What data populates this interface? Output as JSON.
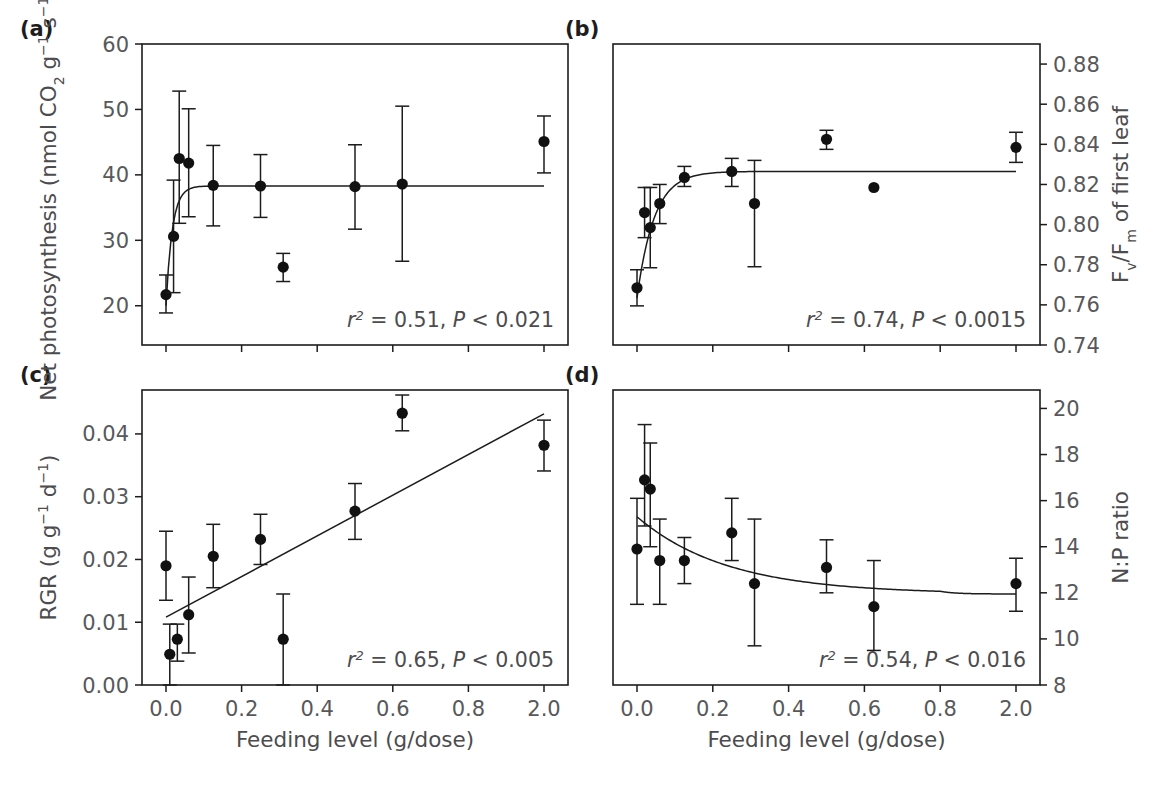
{
  "figure": {
    "xlabel": "Feeding level (g/dose)",
    "x_tick_labels": [
      "0.0",
      "0.2",
      "0.4",
      "0.6",
      "0.8",
      "2.0"
    ],
    "x_tick_values": [
      0.0,
      0.2,
      0.4,
      0.6,
      0.8,
      2.0
    ],
    "panels": [
      "(a)",
      "(b)",
      "(c)",
      "(d)"
    ]
  },
  "chart_data": [
    {
      "id": "a",
      "type": "scatter",
      "panel_label": "(a)",
      "title": "",
      "xlabel": "Feeding level (g/dose)",
      "ylabel": "Net photosynthesis (nmol CO2 g-1 s-1)",
      "ylabel_parts": {
        "prefix": "Net photosynthesis (nmol CO",
        "sub1": "2",
        "mid": " g",
        "sup1": "−1",
        "mid2": " s",
        "sup2": "−1",
        "suffix": ")"
      },
      "yaxis_side": "left",
      "ylim": [
        14,
        60
      ],
      "y_tick_values": [
        20,
        30,
        40,
        50,
        60
      ],
      "y_tick_labels": [
        "20",
        "30",
        "40",
        "50",
        "60"
      ],
      "xlim": [
        -0.07,
        2.13
      ],
      "grid": false,
      "legend": "none",
      "annotation": {
        "r2_label": "r",
        "r2_exp": "2",
        "r2_value": "= 0.51,",
        "p_label": "P",
        "p_value": "< 0.021"
      },
      "fit": {
        "kind": "saturating",
        "plateau": 38.3,
        "y0": 20.0,
        "k": 60.0,
        "x_start": 0.0,
        "x_end": 2.0
      },
      "points": [
        {
          "x": 0.0,
          "y": 21.7,
          "lo": 18.9,
          "hi": 24.7
        },
        {
          "x": 0.02,
          "y": 30.6,
          "lo": 22.0,
          "hi": 39.2
        },
        {
          "x": 0.035,
          "y": 42.5,
          "lo": 32.6,
          "hi": 52.8
        },
        {
          "x": 0.06,
          "y": 41.8,
          "lo": 33.6,
          "hi": 50.1
        },
        {
          "x": 0.125,
          "y": 38.4,
          "lo": 32.2,
          "hi": 44.5
        },
        {
          "x": 0.25,
          "y": 38.3,
          "lo": 33.5,
          "hi": 43.1
        },
        {
          "x": 0.31,
          "y": 25.9,
          "lo": 23.7,
          "hi": 28.0
        },
        {
          "x": 0.5,
          "y": 38.2,
          "lo": 31.7,
          "hi": 44.6
        },
        {
          "x": 0.625,
          "y": 38.6,
          "lo": 26.8,
          "hi": 50.5
        },
        {
          "x": 2.0,
          "y": 45.1,
          "lo": 40.3,
          "hi": 49.0
        }
      ]
    },
    {
      "id": "b",
      "type": "scatter",
      "panel_label": "(b)",
      "title": "",
      "xlabel": "Feeding level (g/dose)",
      "ylabel": "Fv/Fm of first leaf",
      "ylabel_parts": {
        "f1": "F",
        "sub1": "v",
        "slash": "/F",
        "sub2": "m",
        "suffix": " of first leaf"
      },
      "yaxis_side": "right",
      "ylim": [
        0.74,
        0.89
      ],
      "y_tick_values": [
        0.74,
        0.76,
        0.78,
        0.8,
        0.82,
        0.84,
        0.86,
        0.88
      ],
      "y_tick_labels": [
        "0.74",
        "0.76",
        "0.78",
        "0.80",
        "0.82",
        "0.84",
        "0.86",
        "0.88"
      ],
      "xlim": [
        -0.07,
        2.13
      ],
      "grid": false,
      "legend": "none",
      "annotation": {
        "r2_label": "r",
        "r2_exp": "2",
        "r2_value": "= 0.74,",
        "p_label": "P",
        "p_value": "< 0.0015"
      },
      "fit": {
        "kind": "saturating",
        "plateau": 0.8265,
        "y0": 0.7635,
        "k": 22.0,
        "x_start": 0.0,
        "x_end": 2.0
      },
      "points": [
        {
          "x": 0.0,
          "y": 0.7685,
          "lo": 0.7595,
          "hi": 0.7775
        },
        {
          "x": 0.02,
          "y": 0.806,
          "lo": 0.7935,
          "hi": 0.8185
        },
        {
          "x": 0.035,
          "y": 0.7985,
          "lo": 0.7785,
          "hi": 0.8185
        },
        {
          "x": 0.06,
          "y": 0.8105,
          "lo": 0.8005,
          "hi": 0.82
        },
        {
          "x": 0.125,
          "y": 0.8235,
          "lo": 0.819,
          "hi": 0.829
        },
        {
          "x": 0.25,
          "y": 0.8265,
          "lo": 0.819,
          "hi": 0.833
        },
        {
          "x": 0.31,
          "y": 0.8105,
          "lo": 0.779,
          "hi": 0.832
        },
        {
          "x": 0.5,
          "y": 0.8425,
          "lo": 0.8375,
          "hi": 0.847
        },
        {
          "x": 0.625,
          "y": 0.8185,
          "lo": 0.8185,
          "hi": 0.8185
        },
        {
          "x": 2.0,
          "y": 0.8385,
          "lo": 0.831,
          "hi": 0.846
        }
      ]
    },
    {
      "id": "c",
      "type": "scatter",
      "panel_label": "(c)",
      "title": "",
      "xlabel": "Feeding level (g/dose)",
      "ylabel": "RGR (g g-1 d-1)",
      "ylabel_parts": {
        "prefix": "RGR (g g",
        "sup1": "−1",
        "mid": " d",
        "sup2": "−1",
        "suffix": ")"
      },
      "yaxis_side": "left",
      "ylim": [
        0.0,
        0.047
      ],
      "y_tick_values": [
        0.0,
        0.01,
        0.02,
        0.03,
        0.04
      ],
      "y_tick_labels": [
        "0.00",
        "0.01",
        "0.02",
        "0.03",
        "0.04"
      ],
      "xlim": [
        -0.07,
        2.13
      ],
      "grid": false,
      "legend": "none",
      "annotation": {
        "r2_label": "r",
        "r2_exp": "2",
        "r2_value": "= 0.65,",
        "p_label": "P",
        "p_value": "< 0.005"
      },
      "fit": {
        "kind": "linear",
        "x_start": 0.0,
        "y_start": 0.0108,
        "x_end": 2.0,
        "y_end": 0.0432
      },
      "points": [
        {
          "x": 0.0,
          "y": 0.019,
          "lo": 0.0135,
          "hi": 0.0245
        },
        {
          "x": 0.01,
          "y": 0.0049,
          "lo": 0.0,
          "hi": 0.0097
        },
        {
          "x": 0.03,
          "y": 0.0073,
          "lo": 0.0038,
          "hi": 0.0097
        },
        {
          "x": 0.06,
          "y": 0.0112,
          "lo": 0.0051,
          "hi": 0.0172
        },
        {
          "x": 0.125,
          "y": 0.0205,
          "lo": 0.0155,
          "hi": 0.0256
        },
        {
          "x": 0.25,
          "y": 0.0232,
          "lo": 0.0192,
          "hi": 0.0272
        },
        {
          "x": 0.31,
          "y": 0.0073,
          "lo": 0.0,
          "hi": 0.0145
        },
        {
          "x": 0.5,
          "y": 0.0277,
          "lo": 0.0232,
          "hi": 0.0321
        },
        {
          "x": 0.625,
          "y": 0.0433,
          "lo": 0.0405,
          "hi": 0.0462
        },
        {
          "x": 2.0,
          "y": 0.0382,
          "lo": 0.0341,
          "hi": 0.0422
        }
      ]
    },
    {
      "id": "d",
      "type": "scatter",
      "panel_label": "(d)",
      "title": "",
      "xlabel": "Feeding level (g/dose)",
      "ylabel": "N:P ratio",
      "ylabel_parts": {
        "prefix": "N:P ratio"
      },
      "yaxis_side": "right",
      "ylim": [
        8,
        20.8
      ],
      "y_tick_values": [
        8,
        10,
        12,
        14,
        16,
        18,
        20
      ],
      "y_tick_labels": [
        "8",
        "10",
        "12",
        "14",
        "16",
        "18",
        "20"
      ],
      "xlim": [
        -0.07,
        2.13
      ],
      "grid": false,
      "legend": "none",
      "annotation": {
        "r2_label": "r",
        "r2_exp": "2",
        "r2_value": "= 0.54,",
        "p_label": "P",
        "p_value": "< 0.016"
      },
      "fit": {
        "kind": "decay",
        "y0": 15.3,
        "plateau": 11.95,
        "k": 4.2,
        "x_start": 0.0,
        "x_end": 2.0
      },
      "points": [
        {
          "x": 0.0,
          "y": 13.9,
          "lo": 11.5,
          "hi": 16.1
        },
        {
          "x": 0.02,
          "y": 16.9,
          "lo": 14.9,
          "hi": 19.3
        },
        {
          "x": 0.035,
          "y": 16.5,
          "lo": 14.0,
          "hi": 18.5
        },
        {
          "x": 0.06,
          "y": 13.4,
          "lo": 11.5,
          "hi": 15.2
        },
        {
          "x": 0.125,
          "y": 13.4,
          "lo": 12.4,
          "hi": 14.4
        },
        {
          "x": 0.25,
          "y": 14.6,
          "lo": 13.4,
          "hi": 16.1
        },
        {
          "x": 0.31,
          "y": 12.4,
          "lo": 9.7,
          "hi": 15.2
        },
        {
          "x": 0.5,
          "y": 13.1,
          "lo": 12.0,
          "hi": 14.3
        },
        {
          "x": 0.625,
          "y": 11.4,
          "lo": 9.5,
          "hi": 13.4
        },
        {
          "x": 2.0,
          "y": 12.4,
          "lo": 11.2,
          "hi": 13.5
        }
      ]
    }
  ]
}
